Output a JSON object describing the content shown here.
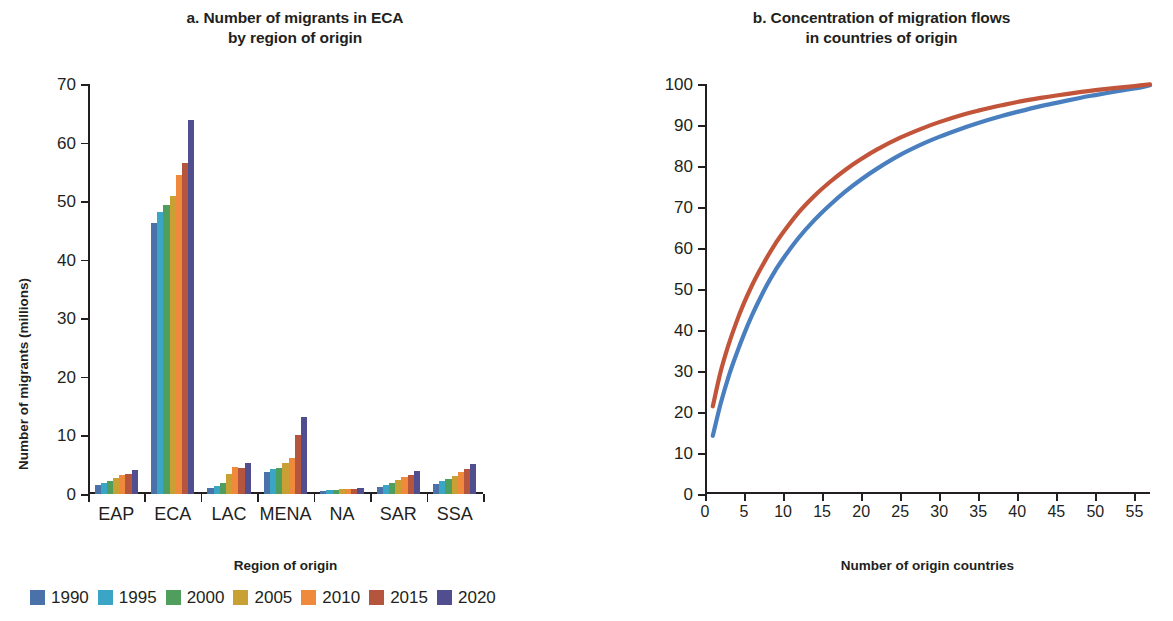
{
  "figure": {
    "panel_a": {
      "title_line1": "a. Number of migrants in ECA",
      "title_line2": "by region of origin",
      "xlabel": "Region of origin",
      "ylabel": "Number of migrants (millions)"
    },
    "panel_b": {
      "title_line1": "b. Concentration of migration flows",
      "title_line2": "in countries of origin",
      "xlabel": "Number of origin countries",
      "ylabel": "Cumulative share of migration flows (%)"
    }
  },
  "chart_data": [
    {
      "type": "bar",
      "title": "a. Number of migrants in ECA by region of origin",
      "xlabel": "Region of origin",
      "ylabel": "Number of migrants (millions)",
      "ylim": [
        0,
        70
      ],
      "yticks": [
        0,
        10,
        20,
        30,
        40,
        50,
        60,
        70
      ],
      "grid": false,
      "legend_position": "bottom",
      "categories": [
        "EAP",
        "ECA",
        "LAC",
        "MENA",
        "NA",
        "SAR",
        "SSA"
      ],
      "series": [
        {
          "name": "1990",
          "color": "#4a72a8",
          "values": [
            1.6,
            46.3,
            1.0,
            3.7,
            0.6,
            1.2,
            1.7
          ]
        },
        {
          "name": "1995",
          "color": "#3ba5c6",
          "values": [
            1.9,
            48.1,
            1.3,
            4.3,
            0.7,
            1.5,
            2.2
          ]
        },
        {
          "name": "2000",
          "color": "#4f9e5e",
          "values": [
            2.2,
            49.3,
            1.8,
            4.5,
            0.7,
            1.9,
            2.6
          ]
        },
        {
          "name": "2005",
          "color": "#c9a033",
          "values": [
            2.7,
            50.9,
            3.5,
            5.3,
            0.8,
            2.4,
            3.1
          ]
        },
        {
          "name": "2010",
          "color": "#ef8a3c",
          "values": [
            3.2,
            54.4,
            4.6,
            6.1,
            0.8,
            2.9,
            3.7
          ]
        },
        {
          "name": "2015",
          "color": "#b5553d",
          "values": [
            3.5,
            56.5,
            4.5,
            10.1,
            0.9,
            3.3,
            4.3
          ]
        },
        {
          "name": "2020",
          "color": "#504e8f",
          "values": [
            4.1,
            63.8,
            5.3,
            13.1,
            1.0,
            4.0,
            5.1
          ]
        }
      ]
    },
    {
      "type": "line",
      "title": "b. Concentration of migration flows in countries of origin",
      "xlabel": "Number of origin countries",
      "ylabel": "Cumulative share of migration flows (%)",
      "xlim": [
        0,
        57
      ],
      "ylim": [
        0,
        100
      ],
      "xticks": [
        0,
        5,
        10,
        15,
        20,
        25,
        30,
        35,
        40,
        45,
        50,
        55
      ],
      "yticks": [
        0,
        10,
        20,
        30,
        40,
        50,
        60,
        70,
        80,
        90,
        100
      ],
      "grid": false,
      "legend_position": "bottom",
      "series": [
        {
          "name": "1990",
          "color": "#4a7fbf",
          "x": [
            1,
            2,
            3,
            4,
            5,
            6,
            7,
            8,
            9,
            10,
            12,
            14,
            16,
            18,
            20,
            22,
            25,
            28,
            30,
            33,
            35,
            38,
            40,
            43,
            45,
            48,
            50,
            53,
            55,
            57
          ],
          "y": [
            14.2,
            22.0,
            28.5,
            34.0,
            39.0,
            43.5,
            47.5,
            51.2,
            54.5,
            57.4,
            62.5,
            66.8,
            70.5,
            73.8,
            76.7,
            79.3,
            82.7,
            85.5,
            87.1,
            89.2,
            90.5,
            92.2,
            93.2,
            94.6,
            95.4,
            96.6,
            97.3,
            98.3,
            98.9,
            99.7
          ]
        },
        {
          "name": "2020",
          "color": "#c2543a",
          "x": [
            1,
            2,
            3,
            4,
            5,
            6,
            7,
            8,
            9,
            10,
            12,
            14,
            16,
            18,
            20,
            22,
            25,
            28,
            30,
            33,
            35,
            38,
            40,
            43,
            45,
            48,
            50,
            53,
            55,
            57
          ],
          "y": [
            21.4,
            29.8,
            36.3,
            41.8,
            46.6,
            50.8,
            54.5,
            57.9,
            61.0,
            63.8,
            68.7,
            72.7,
            76.1,
            79.1,
            81.7,
            84.0,
            86.9,
            89.3,
            90.7,
            92.5,
            93.5,
            94.8,
            95.6,
            96.6,
            97.2,
            98.0,
            98.5,
            99.1,
            99.5,
            99.9
          ]
        }
      ]
    }
  ],
  "legend_a": {
    "items": [
      {
        "label": "1990",
        "color": "#4a72a8"
      },
      {
        "label": "1995",
        "color": "#3ba5c6"
      },
      {
        "label": "2000",
        "color": "#4f9e5e"
      },
      {
        "label": "2005",
        "color": "#c9a033"
      },
      {
        "label": "2010",
        "color": "#ef8a3c"
      },
      {
        "label": "2015",
        "color": "#b5553d"
      },
      {
        "label": "2020",
        "color": "#504e8f"
      }
    ]
  },
  "legend_b": {
    "items": [
      {
        "label": "1990",
        "color": "#4a7fbf"
      },
      {
        "label": "2020",
        "color": "#c2543a"
      }
    ]
  }
}
